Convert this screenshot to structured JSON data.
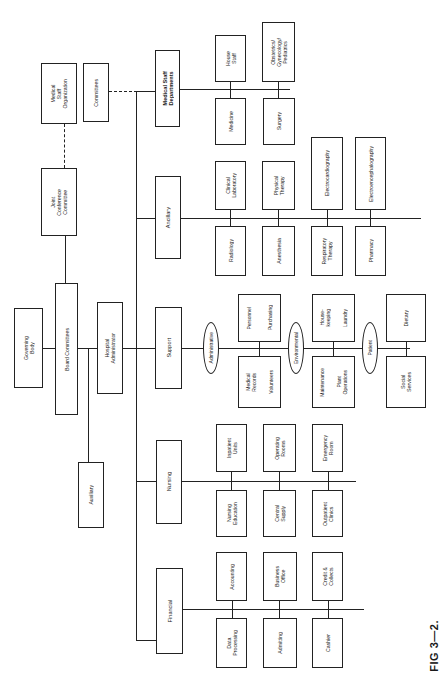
{
  "caption": "FIG 3—2.",
  "top": {
    "medical_staff_organization": "Medical\nStaff\nOrganization",
    "committees": "Committees",
    "joint_conference_committee": "Joint\nConference\nCommittee",
    "governing_body": "Governing\nBody",
    "board_committees": "Board Committees",
    "hospital_administrator": "Hospital\nAdministrator",
    "auxiliary": "Auxiliary"
  },
  "divisions": {
    "medical_staff_departments": {
      "label": "Medical Staff\nDepartments",
      "units": [
        "Medicine",
        "House\nStaff",
        "Surgery",
        "Obstetrics/\nGynecology/\nPediatrics"
      ]
    },
    "ancillary": {
      "label": "Ancillary",
      "units": [
        "Radiology",
        "Clinical\nLaboratory",
        "Anesthesia",
        "Physical\nTherapy",
        "Respiratory\nTherapy",
        "Electrocardiography",
        "Pharmacy",
        "Electroencephalography"
      ]
    },
    "support": {
      "label": "Support",
      "groups": [
        {
          "name": "Administrative",
          "units": [
            "Medical\nRecords",
            "Volunteers",
            "Personnel",
            "Purchasing"
          ]
        },
        {
          "name": "Environmental",
          "units": [
            "Maintenance",
            "Plant\nOperations",
            "House-\nkeeping",
            "Laundry"
          ]
        },
        {
          "name": "Patient",
          "units": [
            "Social\nServices",
            "Dietary"
          ]
        }
      ]
    },
    "nursing": {
      "label": "Nursing",
      "units": [
        "Nursing\nEducation",
        "Inpatient\nUnits",
        "Central\nSupply",
        "Operating\nRooms",
        "Outpatient\nClinics",
        "Emergency\nRoom"
      ]
    },
    "financial": {
      "label": "Financial",
      "units": [
        "Data\nProcessing",
        "Accounting",
        "Admitting",
        "Business\nOffice",
        "Cashier",
        "Credit &\nCollects"
      ]
    }
  }
}
